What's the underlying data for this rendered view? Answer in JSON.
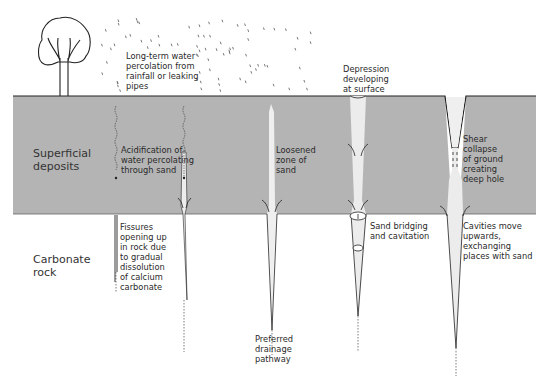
{
  "colors": {
    "superficial_fill": "#b4b4b4",
    "rock_fill": "#ffffff",
    "pipe_fill": "#e6e6e6",
    "line": "#222222",
    "text": "#2a2a2a"
  },
  "layers": {
    "superficial": "Superficial\ndeposits",
    "carbonate": "Carbonate\nrock"
  },
  "annotations": {
    "rainfall": "Long-term water\npercolation from\nrainfall or leaking\npipes",
    "acidification": "Acidification of\nwater percolating\nthrough sand",
    "fissures": "Fissures\nopening up\nin rock due\nto gradual\ndissolution\nof calcium\ncarbonate",
    "loosened": "Loosened\nzone of\nsand",
    "drainage": "Preferred\ndrainage\npathway",
    "depression": "Depression\ndeveloping\nat surface",
    "bridging": "Sand bridging\nand cavitation",
    "shear": "Shear\ncollapse\nof ground\ncreating\ndeep hole",
    "cavities": "Cavities move\nupwards,\nexchanging\nplaces with sand"
  },
  "icons": [
    "tree-icon",
    "rain-drops-icon",
    "flow-arrow-icon"
  ]
}
